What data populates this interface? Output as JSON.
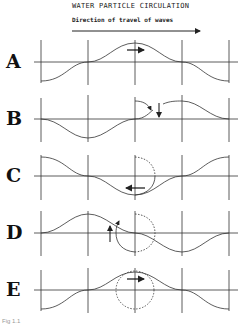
{
  "title": "WATER PARTICLE CIRCULATION",
  "subtitle": "Direction of travel of waves",
  "caption": "Fig 1.1",
  "colors": {
    "line": "#333333",
    "background": "#ffffff"
  },
  "panels": [
    {
      "label": "A",
      "phase": "crest at center",
      "particle_motion": "forward (right)"
    },
    {
      "label": "B",
      "phase": "falling node at center",
      "particle_motion": "downward"
    },
    {
      "label": "C",
      "phase": "trough at center",
      "particle_motion": "backward (left)"
    },
    {
      "label": "D",
      "phase": "rising node at center",
      "particle_motion": "upward"
    },
    {
      "label": "E",
      "phase": "crest at center",
      "particle_motion": "forward (right), full orbit"
    }
  ]
}
